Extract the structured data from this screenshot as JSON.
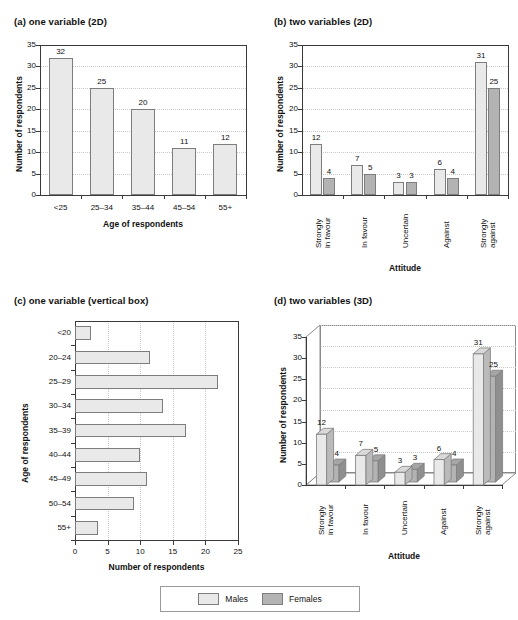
{
  "legend": {
    "items": [
      {
        "label": "Males",
        "color": "#e9e9e9"
      },
      {
        "label": "Females",
        "color": "#b3b3b3"
      }
    ]
  },
  "panels": {
    "a": {
      "title": "(a) one variable (2D)"
    },
    "b": {
      "title": "(b) two variables (2D)"
    },
    "c": {
      "title": "(c) one variable (vertical box)"
    },
    "d": {
      "title": "(d) two variables (3D)"
    }
  },
  "chart_data": [
    {
      "id": "a",
      "type": "bar",
      "title": "(a) one variable (2D)",
      "xlabel": "Age of respondents",
      "ylabel": "Number of respondents",
      "categories": [
        "<25",
        "25–34",
        "35–44",
        "45–54",
        "55+"
      ],
      "values": [
        32,
        25,
        20,
        11,
        12
      ],
      "datalabels": [
        "32",
        "25",
        "20",
        "11",
        "12"
      ],
      "ylim": [
        0,
        35
      ],
      "yticks": [
        0,
        5,
        10,
        15,
        20,
        25,
        30,
        35
      ],
      "yticklabels": [
        "0",
        "5",
        "10",
        "15",
        "20",
        "25",
        "30",
        "35"
      ],
      "grid": true,
      "legend": false,
      "bar_color": "#e9e9e9"
    },
    {
      "id": "b",
      "type": "bar",
      "title": "(b) two variables (2D)",
      "xlabel": "Attitude",
      "ylabel": "Number of respondents",
      "categories": [
        "Strongly in favour",
        "In favour",
        "Uncertain",
        "Against",
        "Strongly against"
      ],
      "category_lines": [
        [
          "Strongly",
          "in favour"
        ],
        [
          "In favour"
        ],
        [
          "Uncertain"
        ],
        [
          "Against"
        ],
        [
          "Strongly",
          "against"
        ]
      ],
      "series": [
        {
          "name": "Males",
          "color": "#e9e9e9",
          "values": [
            12,
            7,
            3,
            6,
            31
          ]
        },
        {
          "name": "Females",
          "color": "#b3b3b3",
          "values": [
            4,
            5,
            3,
            4,
            25
          ]
        }
      ],
      "ylim": [
        0,
        35
      ],
      "yticks": [
        0,
        5,
        10,
        15,
        20,
        25,
        30,
        35
      ],
      "yticklabels": [
        "0",
        "5",
        "10",
        "15",
        "20",
        "25",
        "30",
        "35"
      ],
      "grid": true,
      "legend": true,
      "legend_position": "bottom"
    },
    {
      "id": "c",
      "type": "bar",
      "orientation": "horizontal",
      "title": "(c) one variable (vertical box)",
      "xlabel": "Number of respondents",
      "ylabel": "Age of respondents",
      "categories": [
        "<20",
        "20–24",
        "25–29",
        "30–34",
        "35–39",
        "40–44",
        "45–49",
        "50–54",
        "55+"
      ],
      "values": [
        2.5,
        11.5,
        22,
        13.5,
        17,
        10,
        11,
        9,
        3.5
      ],
      "xlim": [
        0,
        25
      ],
      "xticks": [
        0,
        5,
        10,
        15,
        20,
        25
      ],
      "xticklabels": [
        "0",
        "5",
        "10",
        "15",
        "20",
        "25"
      ],
      "grid": true,
      "legend": false,
      "bar_color": "#e9e9e9"
    },
    {
      "id": "d",
      "type": "bar",
      "render": "3d",
      "title": "(d) two variables (3D)",
      "xlabel": "Attitude",
      "ylabel": "Number of respondents",
      "categories": [
        "Strongly in favour",
        "In favour",
        "Uncertain",
        "Against",
        "Strongly against"
      ],
      "category_lines": [
        [
          "Strongly",
          "in favour"
        ],
        [
          "In favour"
        ],
        [
          "Uncertain"
        ],
        [
          "Against"
        ],
        [
          "Strongly",
          "against"
        ]
      ],
      "series": [
        {
          "name": "Males",
          "color": "#e9e9e9",
          "values": [
            12,
            7,
            3,
            6,
            31
          ]
        },
        {
          "name": "Females",
          "color": "#b3b3b3",
          "values": [
            4,
            5,
            3,
            4,
            25
          ]
        }
      ],
      "ylim": [
        0,
        35
      ],
      "yticks": [
        0,
        5,
        10,
        15,
        20,
        25,
        30,
        35
      ],
      "yticklabels": [
        "0",
        "5",
        "10",
        "15",
        "20",
        "25",
        "30",
        "35"
      ],
      "grid": true,
      "legend": true,
      "legend_position": "bottom"
    }
  ]
}
